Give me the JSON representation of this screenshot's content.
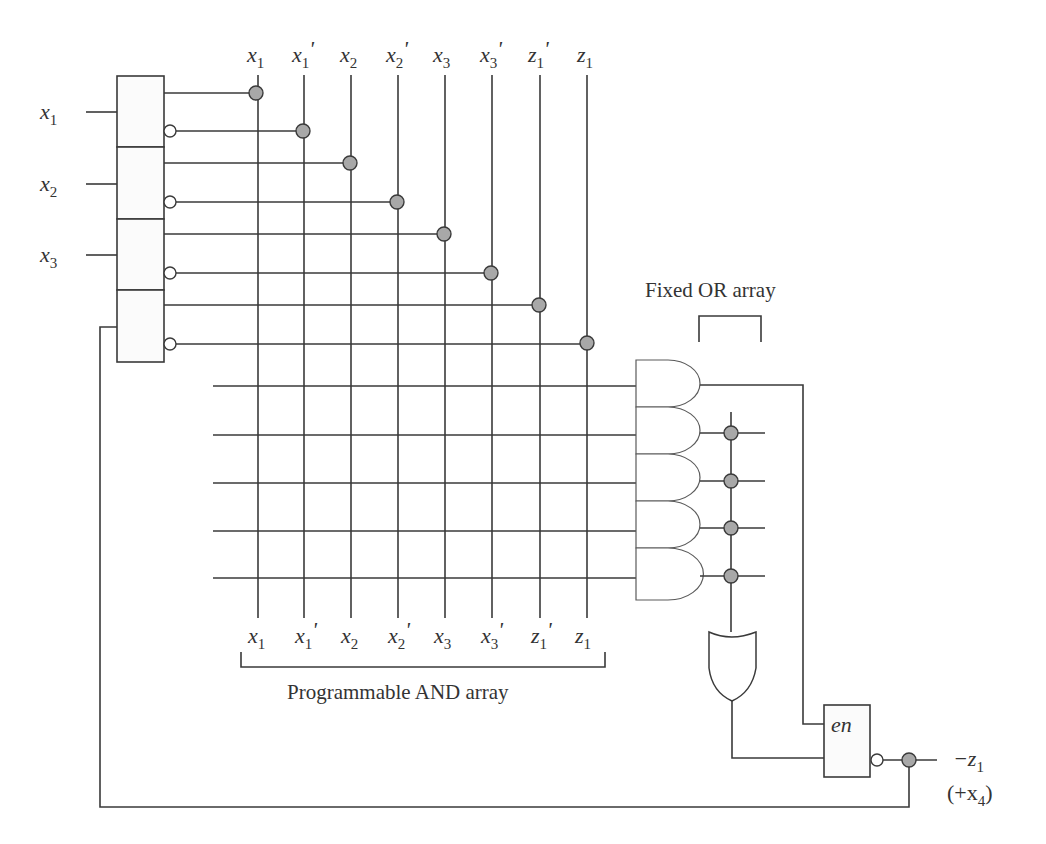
{
  "diagram": {
    "inputs": [
      {
        "name": "x",
        "sub": "1"
      },
      {
        "name": "x",
        "sub": "2"
      },
      {
        "name": "x",
        "sub": "3"
      }
    ],
    "columns": [
      {
        "name": "x",
        "sub": "1",
        "prime": ""
      },
      {
        "name": "x",
        "sub": "1",
        "prime": "'"
      },
      {
        "name": "x",
        "sub": "2",
        "prime": ""
      },
      {
        "name": "x",
        "sub": "2",
        "prime": "'"
      },
      {
        "name": "x",
        "sub": "3",
        "prime": ""
      },
      {
        "name": "x",
        "sub": "3",
        "prime": "'"
      },
      {
        "name": "z",
        "sub": "1",
        "prime": "'"
      },
      {
        "name": "z",
        "sub": "1",
        "prime": ""
      }
    ],
    "and_array_label": "Programmable AND array",
    "or_array_label": "Fixed OR array",
    "product_terms": 5,
    "enable_label": "en",
    "output": {
      "label_main": "−z",
      "label_main_sub": "1",
      "label_alt_open": "(+x",
      "label_alt_sub": "4",
      "label_alt_close": ")"
    },
    "colors": {
      "wire": "#3a3a3a",
      "connection_dot": "#a8a8a8",
      "background": "#ffffff"
    }
  }
}
